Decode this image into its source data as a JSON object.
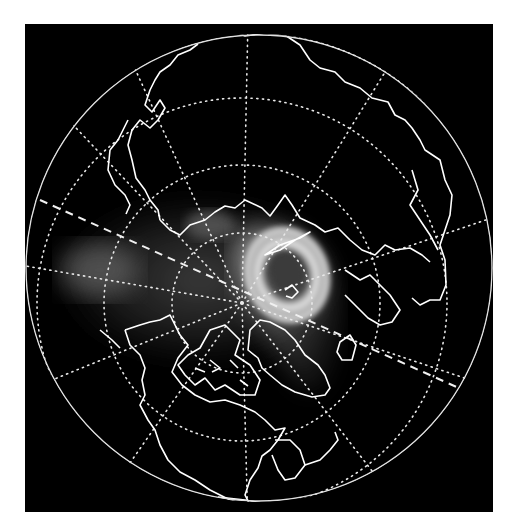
{
  "map": {
    "type": "polar-orthographic",
    "hemisphere": "northern",
    "background_color": "#000000",
    "page_color": "#ffffff",
    "line_color": "#ffffff",
    "frame": {
      "x": 25,
      "y": 24,
      "width": 468,
      "height": 488
    },
    "globe": {
      "cx": 259,
      "cy": 268,
      "r": 234
    },
    "pole": {
      "cx": 242,
      "cy": 303
    },
    "graticule": {
      "latitude_circle_radii": [
        70,
        138,
        205,
        272
      ],
      "meridian_angles_deg": [
        0,
        30,
        60,
        90,
        120,
        150,
        180,
        210,
        240,
        270,
        300,
        330
      ],
      "style": "dotted"
    },
    "terminator": {
      "style": "dashed",
      "from": [
        40,
        205
      ],
      "to": [
        470,
        400
      ]
    },
    "overlay": {
      "description": "bright glow / ring feature over northern Europe and the Arctic, elongated toward Greenland",
      "ring_center": [
        287,
        272
      ],
      "colors": {
        "glow_outer": "#5a5a5a",
        "glow_mid": "#a8a8a8",
        "glow_ring": "#e6e6e6",
        "hole": "#3a3a3a"
      }
    },
    "regions_visible": [
      "Eurasia",
      "North America",
      "Greenland",
      "Canadian Arctic Archipelago",
      "Scandinavia",
      "Iceland",
      "Alaska",
      "Kamchatka",
      "Japan"
    ]
  }
}
